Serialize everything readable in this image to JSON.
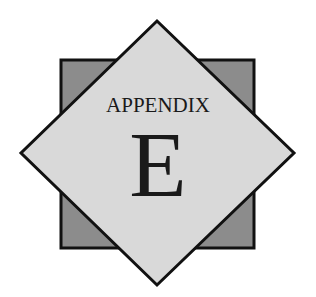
{
  "badge": {
    "title": "APPENDIX",
    "letter": "E"
  },
  "colors": {
    "square_fill": "#8c8c8c",
    "diamond_fill": "#d9d9d9",
    "outline": "#111111",
    "text": "#1a1a1a"
  },
  "shapes": {
    "square": {
      "x": 61,
      "y": 60,
      "width": 193,
      "height": 188
    },
    "diamond": {
      "top": [
        157,
        21
      ],
      "right": [
        294,
        153
      ],
      "bottom": [
        157,
        285
      ],
      "left": [
        21,
        153
      ]
    }
  }
}
